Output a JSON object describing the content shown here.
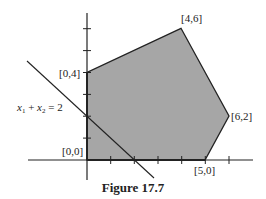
{
  "figure": {
    "caption": "Figure 17.7",
    "region_fill": "#a6a6a6",
    "line_color": "#222222",
    "vertices": [
      {
        "label": "[0,0]",
        "x": 0,
        "y": 0
      },
      {
        "label": "[0,4]",
        "x": 0,
        "y": 4
      },
      {
        "label": "[4,6]",
        "x": 4,
        "y": 6
      },
      {
        "label": "[6,2]",
        "x": 6,
        "y": 2
      },
      {
        "label": "[5,0]",
        "x": 5,
        "y": 0
      }
    ],
    "constraint_line": {
      "label_parts": [
        "x",
        "1",
        " + ",
        "x",
        "2",
        " = 2"
      ],
      "equation": "x1 + x2 = 2"
    },
    "x_ticks": [
      1,
      2,
      3,
      4,
      5,
      6
    ],
    "y_ticks": [
      1,
      2,
      3,
      4,
      5,
      6
    ]
  }
}
